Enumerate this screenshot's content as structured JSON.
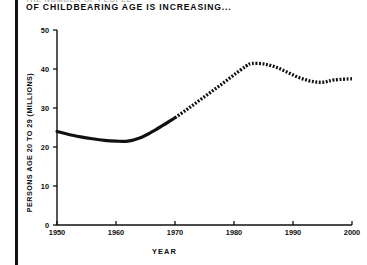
{
  "header": {
    "clipped_line": "THE NUMBER OF PEOPLE",
    "title": "OF CHILDBEARING AGE IS INCREASING..."
  },
  "chart_data": {
    "type": "line",
    "title": "OF CHILDBEARING AGE IS INCREASING...",
    "subtitle": "",
    "xlabel": "YEAR",
    "ylabel": "PERSONS AGE 20 TO 29 (MILLIONS)",
    "xlim": [
      1950,
      2000
    ],
    "ylim": [
      0,
      50
    ],
    "xticks": [
      1950,
      1960,
      1970,
      1980,
      1990,
      2000
    ],
    "xtick_labels": [
      "1950",
      "1960",
      "1970",
      "1980",
      "1990",
      "2000"
    ],
    "yticks": [
      0,
      10,
      20,
      30,
      40,
      50
    ],
    "ytick_labels": [
      "0",
      "10",
      "20",
      "30",
      "40",
      "50"
    ],
    "grid": false,
    "legend": false,
    "series": [
      {
        "name": "Actual",
        "style": "solid",
        "color": "#111111",
        "x": [
          1950,
          1952,
          1954,
          1956,
          1958,
          1960,
          1962,
          1964,
          1966,
          1968,
          1970
        ],
        "values": [
          24.0,
          23.2,
          22.6,
          22.1,
          21.7,
          21.5,
          21.5,
          22.3,
          23.8,
          25.6,
          27.5
        ]
      },
      {
        "name": "Projected",
        "style": "dotted",
        "color": "#111111",
        "x": [
          1970,
          1972,
          1974,
          1976,
          1978,
          1980,
          1982,
          1983,
          1985,
          1987,
          1989,
          1991,
          1993,
          1995,
          1997,
          2000
        ],
        "values": [
          27.5,
          29.6,
          31.8,
          34.0,
          36.2,
          38.5,
          40.7,
          41.4,
          41.3,
          40.5,
          39.2,
          37.8,
          36.9,
          36.6,
          37.2,
          37.5
        ]
      }
    ],
    "annotations": []
  }
}
